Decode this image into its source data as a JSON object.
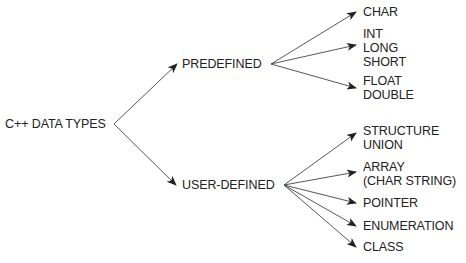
{
  "diagram": {
    "type": "tree",
    "colors": {
      "text": "#222222",
      "line": "#333333",
      "background": "#ffffff"
    },
    "root": {
      "label": "C++ DATA TYPES"
    },
    "branches": [
      {
        "label": "PREDEFINED",
        "children": [
          {
            "lines": [
              "CHAR"
            ]
          },
          {
            "lines": [
              "INT",
              "LONG",
              "SHORT"
            ]
          },
          {
            "lines": [
              "FLOAT",
              "DOUBLE"
            ]
          }
        ]
      },
      {
        "label": "USER-DEFINED",
        "children": [
          {
            "lines": [
              "STRUCTURE",
              "UNION"
            ]
          },
          {
            "lines": [
              "ARRAY",
              "(CHAR STRING)"
            ]
          },
          {
            "lines": [
              "POINTER"
            ]
          },
          {
            "lines": [
              "ENUMERATION"
            ]
          },
          {
            "lines": [
              "CLASS"
            ]
          }
        ]
      }
    ]
  }
}
